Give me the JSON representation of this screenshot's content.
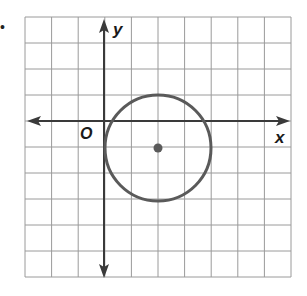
{
  "problem": {
    "bullet": "•"
  },
  "graph": {
    "x_axis_label": "x",
    "y_axis_label": "y",
    "origin_label": "O",
    "grid": {
      "columns": 10,
      "rows": 10,
      "x_range": [
        -3,
        7
      ],
      "y_range": [
        -6,
        4
      ],
      "line_color": "#9a9a9a",
      "axis_color": "#3a3a3a"
    },
    "circle": {
      "center": [
        2,
        -1
      ],
      "radius": 2,
      "stroke_color": "#5a5a5a",
      "center_dot_color": "#5a5a5a"
    }
  },
  "chart_data": {
    "type": "scatter",
    "title": "",
    "xlabel": "x",
    "ylabel": "y",
    "xlim": [
      -3,
      7
    ],
    "ylim": [
      -6,
      4
    ],
    "grid": true,
    "origin_label": "O",
    "shapes": [
      {
        "kind": "circle",
        "center": [
          2,
          -1
        ],
        "radius": 2,
        "equation": "(x - 2)^2 + (y + 1)^2 = 4"
      }
    ],
    "points": [
      {
        "x": 2,
        "y": -1,
        "label": "center"
      }
    ]
  }
}
